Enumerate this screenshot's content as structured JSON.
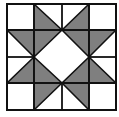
{
  "diagram": {
    "type": "quilt-block",
    "name": "Sawtooth Star",
    "grid": 4,
    "colors": {
      "background": "#ffffff",
      "fill": "#7f7f7f",
      "line": "#111111"
    },
    "bounds": {
      "x0": 7,
      "y0": 4,
      "x1": 116,
      "y1": 110
    },
    "xs": [
      7,
      34,
      62,
      89,
      116
    ],
    "ys": [
      4,
      30,
      57,
      83,
      110
    ],
    "triangles": [
      {
        "id": "r0c1",
        "pts": [
          [
            34,
            4
          ],
          [
            34,
            30
          ],
          [
            62,
            30
          ]
        ]
      },
      {
        "id": "r0c2",
        "pts": [
          [
            89,
            4
          ],
          [
            89,
            30
          ],
          [
            62,
            30
          ]
        ]
      },
      {
        "id": "r1c0",
        "pts": [
          [
            7,
            30
          ],
          [
            34,
            30
          ],
          [
            34,
            57
          ]
        ]
      },
      {
        "id": "r1c1",
        "pts": [
          [
            34,
            30
          ],
          [
            62,
            30
          ],
          [
            34,
            57
          ]
        ]
      },
      {
        "id": "r1c2",
        "pts": [
          [
            62,
            30
          ],
          [
            89,
            30
          ],
          [
            89,
            57
          ]
        ]
      },
      {
        "id": "r1c3",
        "pts": [
          [
            89,
            30
          ],
          [
            116,
            30
          ],
          [
            89,
            57
          ]
        ]
      },
      {
        "id": "r2c0",
        "pts": [
          [
            7,
            83
          ],
          [
            34,
            83
          ],
          [
            34,
            57
          ]
        ]
      },
      {
        "id": "r2c1",
        "pts": [
          [
            34,
            57
          ],
          [
            34,
            83
          ],
          [
            62,
            83
          ]
        ]
      },
      {
        "id": "r2c2",
        "pts": [
          [
            89,
            57
          ],
          [
            89,
            83
          ],
          [
            62,
            83
          ]
        ]
      },
      {
        "id": "r2c3",
        "pts": [
          [
            89,
            57
          ],
          [
            89,
            83
          ],
          [
            116,
            83
          ]
        ]
      },
      {
        "id": "r3c1",
        "pts": [
          [
            34,
            83
          ],
          [
            62,
            83
          ],
          [
            34,
            110
          ]
        ]
      },
      {
        "id": "r3c2",
        "pts": [
          [
            62,
            83
          ],
          [
            89,
            83
          ],
          [
            89,
            110
          ]
        ]
      }
    ]
  }
}
